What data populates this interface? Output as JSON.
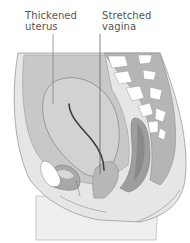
{
  "diagram": {
    "labels": [
      {
        "line1": "Thickened",
        "line2": "uterus"
      },
      {
        "line1": "Stretched",
        "line2": "vagina"
      }
    ],
    "colors": {
      "background": "#ffffff",
      "tissue_light": "#e6e6e6",
      "tissue_mid": "#c8c8c8",
      "tissue_dark": "#a6a6a6",
      "outline": "#8a8a8a",
      "canal": "#3c3c3c",
      "label_text": "#555555"
    }
  }
}
